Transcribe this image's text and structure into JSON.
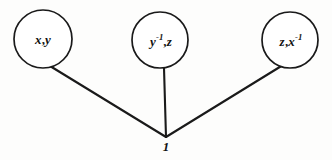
{
  "figure": {
    "type": "node-link-diagram",
    "background_color": "#fdfdfc",
    "stroke_color": "#1a1a1a",
    "text_color": "#111111",
    "width": 332,
    "height": 160
  },
  "nodes": [
    {
      "id": "node-left",
      "label_prefix": "x",
      "label_exponent": "",
      "label_comma": ",",
      "label_suffix": "y",
      "label_text": "x,y",
      "cx": 43,
      "cy": 39,
      "r": 29
    },
    {
      "id": "node-middle",
      "label_prefix": "y",
      "label_exponent": "-1",
      "label_comma": ",",
      "label_suffix": "z",
      "label_text": "y-1,z",
      "cx": 160,
      "cy": 40,
      "r": 28
    },
    {
      "id": "node-right",
      "label_prefix": "z",
      "label_exponent": "",
      "label_comma": ",",
      "label_suffix": "x",
      "label_suffix_exponent": "-1",
      "label_text": "z,x-1",
      "cx": 290,
      "cy": 40,
      "r": 28
    }
  ],
  "vertex": {
    "id": "vertex-one",
    "label": "1",
    "x": 166,
    "y": 137,
    "label_x": 166,
    "label_y": 139
  },
  "edges": [
    {
      "id": "edge-left",
      "from": "node-left",
      "to": "vertex-one",
      "x1": 50,
      "y1": 66,
      "x2": 166,
      "y2": 137
    },
    {
      "id": "edge-middle",
      "from": "node-middle",
      "to": "vertex-one",
      "x1": 164,
      "y1": 68,
      "x2": 166,
      "y2": 137
    },
    {
      "id": "edge-right",
      "from": "node-right",
      "to": "vertex-one",
      "x1": 283,
      "y1": 65,
      "x2": 166,
      "y2": 137
    }
  ]
}
